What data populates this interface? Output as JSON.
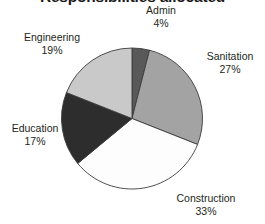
{
  "chart_data": {
    "type": "pie",
    "title": "Responsibilities allocated",
    "xlabel": "",
    "ylabel": "",
    "legend": "none",
    "grid": false,
    "start_angle_deg": 0,
    "direction": "clockwise",
    "categories": [
      "Admin",
      "Sanitation",
      "Construction",
      "Education",
      "Engineering"
    ],
    "values": [
      4,
      27,
      33,
      17,
      19
    ],
    "value_unit": "%",
    "slices": [
      {
        "label": "Admin",
        "value": 4,
        "display_value": "4%",
        "color": "#595959"
      },
      {
        "label": "Sanitation",
        "value": 27,
        "display_value": "27%",
        "color": "#a3a3a3"
      },
      {
        "label": "Construction",
        "value": 33,
        "display_value": "33%",
        "color": "#fdfdfd"
      },
      {
        "label": "Education",
        "value": 17,
        "display_value": "17%",
        "color": "#2d2d2d"
      },
      {
        "label": "Engineering",
        "value": 19,
        "display_value": "19%",
        "color": "#c9c9c9"
      }
    ],
    "outline_color": "#3b3b3b"
  },
  "title": {
    "text": "Responsibilities allocated"
  },
  "labels": {
    "admin": {
      "name": "Admin",
      "pct": "4%"
    },
    "sanitation": {
      "name": "Sanitation",
      "pct": "27%"
    },
    "construction": {
      "name": "Construction",
      "pct": "33%"
    },
    "education": {
      "name": "Education",
      "pct": "17%"
    },
    "engineering": {
      "name": "Engineering",
      "pct": "19%"
    }
  }
}
